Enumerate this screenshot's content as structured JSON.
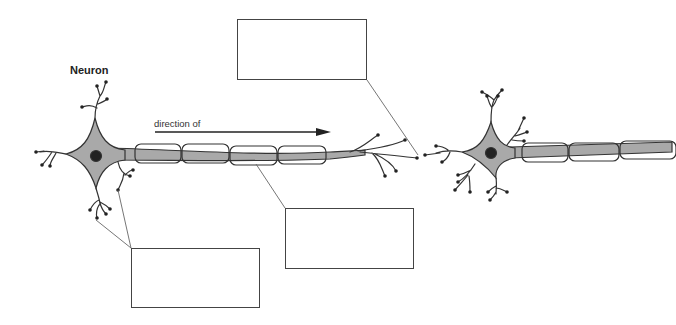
{
  "diagram": {
    "title": "Neuron",
    "arrow_label": "direction of",
    "colors": {
      "cell_fill": "#a9a9a9",
      "outline": "#333333",
      "nucleus": "#222222",
      "leader_line": "#666666",
      "box_border": "#444444"
    },
    "label_boxes": [
      {
        "id": "top",
        "x": 237,
        "y": 19,
        "w": 130,
        "h": 61,
        "text": ""
      },
      {
        "id": "middle",
        "x": 285,
        "y": 208,
        "w": 129,
        "h": 61,
        "text": ""
      },
      {
        "id": "bottom-left",
        "x": 131,
        "y": 248,
        "w": 129,
        "h": 60,
        "text": ""
      }
    ]
  }
}
